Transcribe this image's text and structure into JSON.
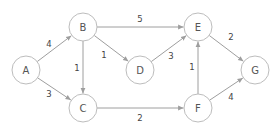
{
  "graph": {
    "type": "weighted-directed-graph",
    "node_radius": 14,
    "colors": {
      "node_stroke": "#bdbdbd",
      "edge": "#9e9e9e",
      "text": "#555555"
    },
    "nodes": [
      {
        "id": "A",
        "label": "A",
        "x": 26,
        "y": 70
      },
      {
        "id": "B",
        "label": "B",
        "x": 83,
        "y": 27
      },
      {
        "id": "C",
        "label": "C",
        "x": 83,
        "y": 108
      },
      {
        "id": "D",
        "label": "D",
        "x": 140,
        "y": 70
      },
      {
        "id": "E",
        "label": "E",
        "x": 198,
        "y": 27
      },
      {
        "id": "F",
        "label": "F",
        "x": 198,
        "y": 108
      },
      {
        "id": "G",
        "label": "G",
        "x": 255,
        "y": 70
      }
    ],
    "edges": [
      {
        "from": "A",
        "to": "B",
        "weight": "4",
        "lx": 49,
        "ly": 44
      },
      {
        "from": "A",
        "to": "C",
        "weight": "3",
        "lx": 49,
        "ly": 94
      },
      {
        "from": "B",
        "to": "C",
        "weight": "1",
        "lx": 77,
        "ly": 68
      },
      {
        "from": "B",
        "to": "D",
        "weight": "1",
        "lx": 104,
        "ly": 55
      },
      {
        "from": "B",
        "to": "E",
        "weight": "5",
        "lx": 140,
        "ly": 19
      },
      {
        "from": "D",
        "to": "E",
        "weight": "3",
        "lx": 171,
        "ly": 56
      },
      {
        "from": "C",
        "to": "F",
        "weight": "2",
        "lx": 140,
        "ly": 118
      },
      {
        "from": "F",
        "to": "E",
        "weight": "1",
        "lx": 192,
        "ly": 67
      },
      {
        "from": "E",
        "to": "G",
        "weight": "2",
        "lx": 231,
        "ly": 37
      },
      {
        "from": "F",
        "to": "G",
        "weight": "4",
        "lx": 231,
        "ly": 97
      }
    ]
  }
}
